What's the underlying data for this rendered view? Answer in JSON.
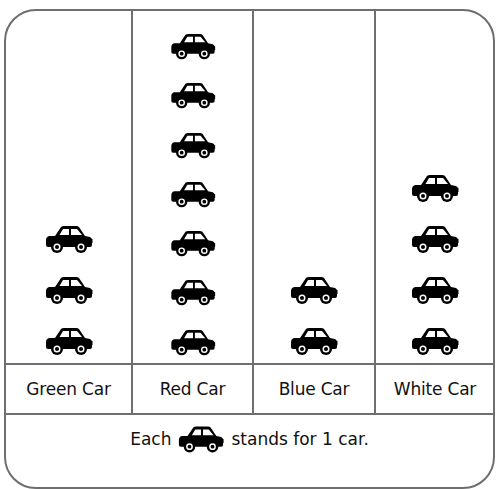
{
  "chart_data": {
    "type": "pictograph",
    "title": "",
    "categories": [
      "Green Car",
      "Red Car",
      "Blue Car",
      "White Car"
    ],
    "values": [
      3,
      7,
      2,
      4
    ],
    "icon": "car-icon",
    "key": "Each car icon stands for 1 car.",
    "unit_per_icon": 1
  },
  "labels": [
    "Green Car",
    "Red Car",
    "Blue Car",
    "White Car"
  ],
  "legend": {
    "prefix": "Each",
    "suffix": "stands for 1 car."
  },
  "colors": {
    "border": "#6e6e6e",
    "icon": "#000000",
    "text": "#111111"
  }
}
